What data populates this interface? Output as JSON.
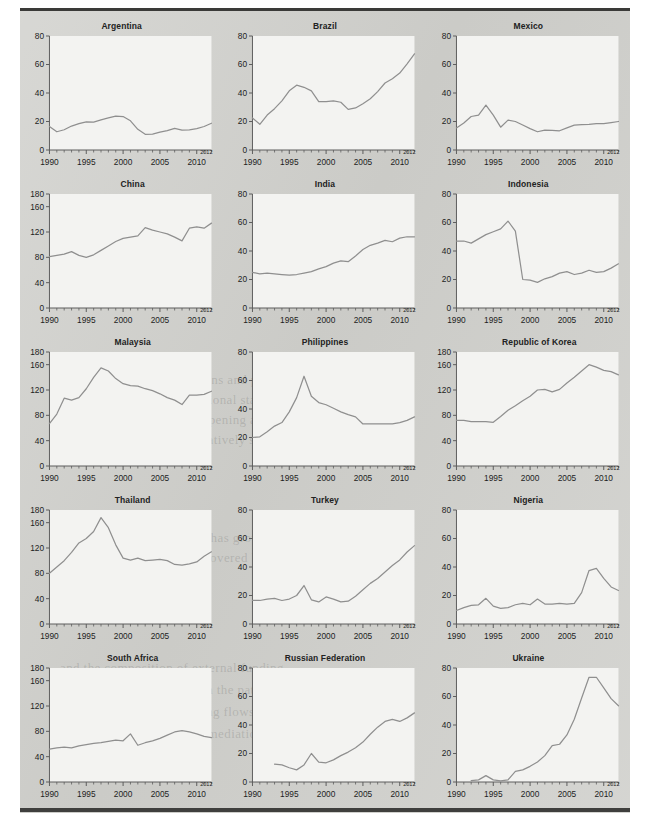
{
  "figure": {
    "x_tick_labels": [
      "1990",
      "1995",
      "2000",
      "2005",
      "2010"
    ],
    "x_end_label": "2012",
    "x_min": 1990,
    "x_max": 2012,
    "y_ticks_80": [
      "0",
      "20",
      "40",
      "60",
      "80"
    ],
    "y_ticks_180": [
      "0",
      "40",
      "80",
      "120",
      "160",
      "180"
    ],
    "line_color": "#8f8f8f",
    "axis_color": "#5c5c5c",
    "panel_bg": "#f3f3f1",
    "page_bg": "#cfcfcb"
  },
  "bleed_text": [
    "their own national conditions and priorities",
    "on the basis of the international standards",
    "the degree of financial deepening and the",
    "markets have remained relatively shallow",
    "credit to the private sector has grown",
    "in most of the economies covered by the",
    "and the composition of external funding",
    "reflecting a broader shift in the pattern",
    "of cross border bank lending flows",
    "of domestic financial intermediation"
  ],
  "chart_data": [
    {
      "type": "line",
      "title": "Argentina",
      "xlabel": "",
      "ylabel": "",
      "xlim": [
        1990,
        2012
      ],
      "ylim": [
        0,
        80
      ],
      "yticks": [
        0,
        20,
        40,
        60,
        80
      ],
      "grid": false,
      "legend": null,
      "x": [
        1990,
        1991,
        1992,
        1993,
        1994,
        1995,
        1996,
        1997,
        1998,
        1999,
        2000,
        2001,
        2002,
        2003,
        2004,
        2005,
        2006,
        2007,
        2008,
        2009,
        2010,
        2011,
        2012
      ],
      "values": [
        16.5,
        12.8,
        14.2,
        16.8,
        18.5,
        19.8,
        19.6,
        21.2,
        22.5,
        23.8,
        23.5,
        20.5,
        14.5,
        11.0,
        11.2,
        12.5,
        13.6,
        15.2,
        14.0,
        14.2,
        15.0,
        16.5,
        18.8
      ]
    },
    {
      "type": "line",
      "title": "Brazil",
      "xlabel": "",
      "ylabel": "",
      "xlim": [
        1990,
        2012
      ],
      "ylim": [
        0,
        80
      ],
      "yticks": [
        0,
        20,
        40,
        60,
        80
      ],
      "grid": false,
      "legend": null,
      "x": [
        1990,
        1991,
        1992,
        1993,
        1994,
        1995,
        1996,
        1997,
        1998,
        1999,
        2000,
        2001,
        2002,
        2003,
        2004,
        2005,
        2006,
        2007,
        2008,
        2009,
        2010,
        2011,
        2012
      ],
      "values": [
        22.5,
        18.0,
        24.5,
        29.0,
        34.5,
        41.5,
        45.5,
        44.0,
        41.5,
        34.0,
        34.0,
        34.5,
        33.5,
        28.5,
        29.5,
        32.5,
        36.0,
        41.0,
        47.0,
        50.0,
        54.0,
        60.5,
        67.5
      ]
    },
    {
      "type": "line",
      "title": "Mexico",
      "xlabel": "",
      "ylabel": "",
      "xlim": [
        1990,
        2012
      ],
      "ylim": [
        0,
        80
      ],
      "yticks": [
        0,
        20,
        40,
        60,
        80
      ],
      "grid": false,
      "legend": null,
      "x": [
        1990,
        1991,
        1992,
        1993,
        1994,
        1995,
        1996,
        1997,
        1998,
        1999,
        2000,
        2001,
        2002,
        2003,
        2004,
        2005,
        2006,
        2007,
        2008,
        2009,
        2010,
        2011,
        2012
      ],
      "values": [
        15.5,
        19.0,
        23.5,
        24.5,
        31.5,
        24.5,
        16.0,
        21.0,
        20.0,
        17.5,
        15.0,
        12.8,
        14.0,
        13.8,
        13.5,
        15.5,
        17.5,
        17.8,
        18.0,
        18.5,
        18.5,
        19.2,
        20.0
      ]
    },
    {
      "type": "line",
      "title": "China",
      "xlabel": "",
      "ylabel": "",
      "xlim": [
        1990,
        2012
      ],
      "ylim": [
        0,
        180
      ],
      "yticks": [
        0,
        40,
        80,
        120,
        160,
        180
      ],
      "grid": false,
      "legend": null,
      "x": [
        1990,
        1991,
        1992,
        1993,
        1994,
        1995,
        1996,
        1997,
        1998,
        1999,
        2000,
        2001,
        2002,
        2003,
        2004,
        2005,
        2006,
        2007,
        2008,
        2009,
        2010,
        2011,
        2012
      ],
      "values": [
        81,
        83,
        85,
        89,
        83,
        80,
        84,
        91,
        98,
        105,
        110,
        112,
        114,
        127,
        123,
        120,
        117,
        112,
        106,
        126,
        128,
        126,
        134
      ]
    },
    {
      "type": "line",
      "title": "India",
      "xlabel": "",
      "ylabel": "",
      "xlim": [
        1990,
        2012
      ],
      "ylim": [
        0,
        80
      ],
      "yticks": [
        0,
        20,
        40,
        60,
        80
      ],
      "grid": false,
      "legend": null,
      "x": [
        1990,
        1991,
        1992,
        1993,
        1994,
        1995,
        1996,
        1997,
        1998,
        1999,
        2000,
        2001,
        2002,
        2003,
        2004,
        2005,
        2006,
        2007,
        2008,
        2009,
        2010,
        2011,
        2012
      ],
      "values": [
        25.0,
        24.0,
        24.5,
        24.0,
        23.5,
        23.0,
        23.5,
        24.5,
        25.5,
        27.5,
        29.0,
        31.5,
        33.0,
        32.5,
        36.5,
        41.0,
        44.0,
        45.5,
        47.5,
        46.5,
        49.0,
        50.0,
        50.0
      ]
    },
    {
      "type": "line",
      "title": "Indonesia",
      "xlabel": "",
      "ylabel": "",
      "xlim": [
        1990,
        2012
      ],
      "ylim": [
        0,
        80
      ],
      "yticks": [
        0,
        20,
        40,
        60,
        80
      ],
      "grid": false,
      "legend": null,
      "x": [
        1990,
        1991,
        1992,
        1993,
        1994,
        1995,
        1996,
        1997,
        1998,
        1999,
        2000,
        2001,
        2002,
        2003,
        2004,
        2005,
        2006,
        2007,
        2008,
        2009,
        2010,
        2011,
        2012
      ],
      "values": [
        47,
        47,
        45.5,
        48.5,
        51.5,
        53.5,
        55.5,
        61,
        54,
        20,
        19.5,
        18.0,
        20.5,
        22.0,
        24.5,
        25.5,
        23.5,
        24.5,
        26.5,
        25.0,
        25.5,
        28.0,
        31.0
      ]
    },
    {
      "type": "line",
      "title": "Malaysia",
      "xlabel": "",
      "ylabel": "",
      "xlim": [
        1990,
        2012
      ],
      "ylim": [
        0,
        180
      ],
      "yticks": [
        0,
        40,
        80,
        120,
        160,
        180
      ],
      "grid": false,
      "legend": null,
      "x": [
        1990,
        1991,
        1992,
        1993,
        1994,
        1995,
        1996,
        1997,
        1998,
        1999,
        2000,
        2001,
        2002,
        2003,
        2004,
        2005,
        2006,
        2007,
        2008,
        2009,
        2010,
        2011,
        2012
      ],
      "values": [
        67,
        82,
        107,
        104,
        108,
        122,
        140,
        155,
        150,
        138,
        130,
        127,
        126,
        122,
        119,
        114,
        108,
        104,
        97,
        112,
        112,
        113,
        118
      ]
    },
    {
      "type": "line",
      "title": "Philippines",
      "xlabel": "",
      "ylabel": "",
      "xlim": [
        1990,
        2012
      ],
      "ylim": [
        0,
        80
      ],
      "yticks": [
        0,
        20,
        40,
        60,
        80
      ],
      "grid": false,
      "legend": null,
      "x": [
        1990,
        1991,
        1992,
        1993,
        1994,
        1995,
        1996,
        1997,
        1998,
        1999,
        2000,
        2001,
        2002,
        2003,
        2004,
        2005,
        2006,
        2007,
        2008,
        2009,
        2010,
        2011,
        2012
      ],
      "values": [
        20.0,
        20.5,
        24.0,
        28.0,
        30.5,
        38.0,
        48.0,
        63.0,
        49.0,
        44.5,
        43.0,
        40.5,
        38.0,
        36.0,
        34.5,
        29.5,
        29.5,
        29.5,
        29.5,
        29.5,
        30.5,
        32.0,
        34.5
      ]
    },
    {
      "type": "line",
      "title": "Republic of Korea",
      "xlabel": "",
      "ylabel": "",
      "xlim": [
        1990,
        2012
      ],
      "ylim": [
        0,
        180
      ],
      "yticks": [
        0,
        40,
        80,
        120,
        160,
        180
      ],
      "grid": false,
      "legend": null,
      "x": [
        1990,
        1991,
        1992,
        1993,
        1994,
        1995,
        1996,
        1997,
        1998,
        1999,
        2000,
        2001,
        2002,
        2003,
        2004,
        2005,
        2006,
        2007,
        2008,
        2009,
        2010,
        2011,
        2012
      ],
      "values": [
        72,
        72,
        70,
        70,
        70,
        69,
        78,
        88,
        95,
        103,
        110,
        120,
        121,
        117,
        121,
        131,
        140,
        150,
        160,
        156,
        151,
        149,
        144
      ]
    },
    {
      "type": "line",
      "title": "Thailand",
      "xlabel": "",
      "ylabel": "",
      "xlim": [
        1990,
        2012
      ],
      "ylim": [
        0,
        180
      ],
      "yticks": [
        0,
        40,
        80,
        120,
        160,
        180
      ],
      "grid": false,
      "legend": null,
      "x": [
        1990,
        1991,
        1992,
        1993,
        1994,
        1995,
        1996,
        1997,
        1998,
        1999,
        2000,
        2001,
        2002,
        2003,
        2004,
        2005,
        2006,
        2007,
        2008,
        2009,
        2010,
        2011,
        2012
      ],
      "values": [
        80,
        90,
        100,
        113,
        128,
        135,
        146,
        168,
        152,
        125,
        104,
        101,
        104,
        100,
        101,
        102,
        100,
        94,
        93,
        95,
        98,
        107,
        114
      ]
    },
    {
      "type": "line",
      "title": "Turkey",
      "xlabel": "",
      "ylabel": "",
      "xlim": [
        1990,
        2012
      ],
      "ylim": [
        0,
        80
      ],
      "yticks": [
        0,
        20,
        40,
        60,
        80
      ],
      "grid": false,
      "legend": null,
      "x": [
        1990,
        1991,
        1992,
        1993,
        1994,
        1995,
        1996,
        1997,
        1998,
        1999,
        2000,
        2001,
        2002,
        2003,
        2004,
        2005,
        2006,
        2007,
        2008,
        2009,
        2010,
        2011,
        2012
      ],
      "values": [
        16.5,
        16.5,
        17.5,
        18.0,
        16.5,
        17.5,
        20.0,
        27.0,
        17.0,
        15.5,
        19.0,
        17.5,
        15.5,
        16.0,
        19.5,
        24.0,
        28.5,
        32.0,
        36.5,
        41.0,
        45.0,
        50.5,
        55.0
      ]
    },
    {
      "type": "line",
      "title": "Nigeria",
      "xlabel": "",
      "ylabel": "",
      "xlim": [
        1990,
        2012
      ],
      "ylim": [
        0,
        80
      ],
      "yticks": [
        0,
        20,
        40,
        60,
        80
      ],
      "grid": false,
      "legend": null,
      "x": [
        1990,
        1991,
        1992,
        1993,
        1994,
        1995,
        1996,
        1997,
        1998,
        1999,
        2000,
        2001,
        2002,
        2003,
        2004,
        2005,
        2006,
        2007,
        2008,
        2009,
        2010,
        2011,
        2012
      ],
      "values": [
        9.5,
        11.5,
        13.0,
        13.5,
        18.0,
        12.5,
        11.0,
        11.5,
        13.5,
        14.5,
        13.5,
        17.5,
        14.0,
        14.0,
        14.5,
        14.0,
        14.5,
        22.0,
        37.5,
        39.0,
        32.0,
        26.0,
        23.5
      ]
    },
    {
      "type": "line",
      "title": "South Africa",
      "xlabel": "",
      "ylabel": "",
      "xlim": [
        1990,
        2012
      ],
      "ylim": [
        0,
        180
      ],
      "yticks": [
        0,
        40,
        80,
        120,
        160,
        180
      ],
      "grid": false,
      "legend": null,
      "x": [
        1990,
        1991,
        1992,
        1993,
        1994,
        1995,
        1996,
        1997,
        1998,
        1999,
        2000,
        2001,
        2002,
        2003,
        2004,
        2005,
        2006,
        2007,
        2008,
        2009,
        2010,
        2011,
        2012
      ],
      "values": [
        52,
        54,
        55,
        54,
        57,
        59,
        61,
        62,
        64,
        66,
        65,
        76,
        58,
        62,
        65,
        69,
        74,
        79,
        81,
        79,
        76,
        72,
        70
      ]
    },
    {
      "type": "line",
      "title": "Russian Federation",
      "xlabel": "",
      "ylabel": "",
      "xlim": [
        1990,
        2012
      ],
      "ylim": [
        0,
        80
      ],
      "yticks": [
        0,
        20,
        40,
        60,
        80
      ],
      "grid": false,
      "legend": null,
      "x": [
        1993,
        1994,
        1995,
        1996,
        1997,
        1998,
        1999,
        2000,
        2001,
        2002,
        2003,
        2004,
        2005,
        2006,
        2007,
        2008,
        2009,
        2010,
        2011,
        2012
      ],
      "values": [
        12.5,
        12.0,
        10.0,
        8.5,
        12.0,
        20.0,
        14.0,
        13.5,
        15.5,
        18.5,
        21.0,
        24.0,
        28.0,
        33.5,
        38.5,
        42.5,
        44.0,
        42.5,
        45.0,
        48.5
      ]
    },
    {
      "type": "line",
      "title": "Ukraine",
      "xlabel": "",
      "ylabel": "",
      "xlim": [
        1990,
        2012
      ],
      "ylim": [
        0,
        80
      ],
      "yticks": [
        0,
        20,
        40,
        60,
        80
      ],
      "grid": false,
      "legend": null,
      "x": [
        1992,
        1993,
        1994,
        1995,
        1996,
        1997,
        1998,
        1999,
        2000,
        2001,
        2002,
        2003,
        2004,
        2005,
        2006,
        2007,
        2008,
        2009,
        2010,
        2011,
        2012
      ],
      "values": [
        1.0,
        1.5,
        4.5,
        1.5,
        0.8,
        1.5,
        7.5,
        8.5,
        11.0,
        14.0,
        18.5,
        25.5,
        26.5,
        33.0,
        44.0,
        59.0,
        73.5,
        73.5,
        66.0,
        58.5,
        53.5
      ]
    }
  ]
}
